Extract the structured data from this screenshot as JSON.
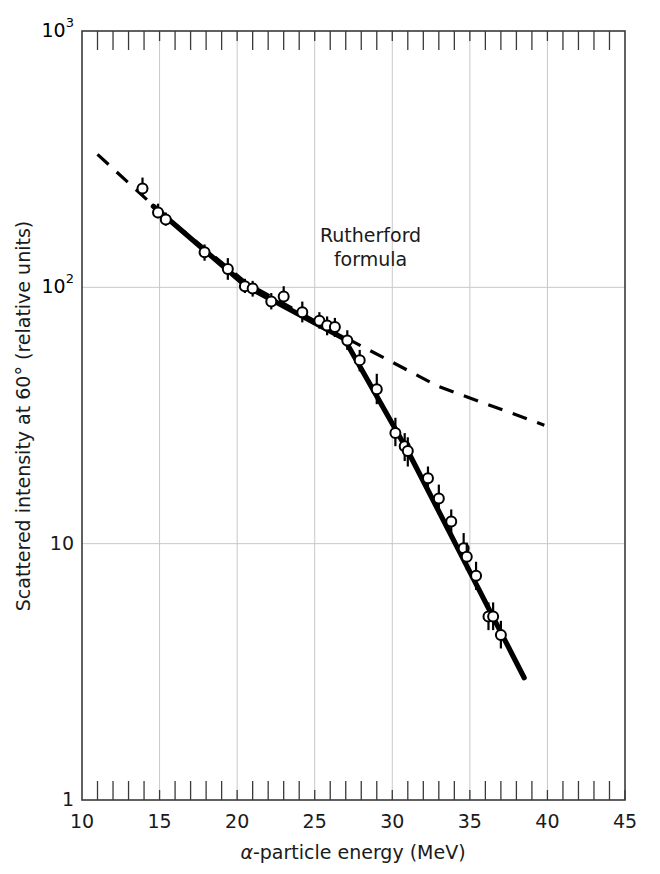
{
  "figure": {
    "background_color": "#ffffff",
    "frame_color": "#3a3a3a",
    "grid_color": "#c8c8c8",
    "data_color": "#000000"
  },
  "axes": {
    "x": {
      "label": "α-particle energy (MeV)",
      "label_parts": {
        "alpha": "α",
        "rest": "-particle energy (MeV)"
      },
      "scale": "linear",
      "min": 10,
      "max": 45,
      "major_ticks": [
        10,
        15,
        20,
        25,
        30,
        35,
        40,
        45
      ],
      "major_tick_labels": [
        "10",
        "15",
        "20",
        "25",
        "30",
        "35",
        "40",
        "45"
      ],
      "minor_tick_step": 1,
      "gridlines_at": [
        15,
        20,
        25,
        30,
        35,
        40
      ]
    },
    "y": {
      "label": "Scattered intensity at 60° (relative units)",
      "scale": "log",
      "min": 1,
      "max": 1000,
      "major_ticks": [
        1,
        10,
        100,
        1000
      ],
      "major_tick_labels": [
        "1",
        "10",
        "10",
        "10"
      ],
      "tick_label_1": "1",
      "tick_label_10": "10",
      "tick_label_100_base": "10",
      "tick_label_100_exp": "2",
      "tick_label_1000_base": "10",
      "tick_label_1000_exp": "3",
      "gridlines_at": [
        10,
        100
      ]
    }
  },
  "annotations": [
    {
      "id": "rutherford-label",
      "line1": "Rutherford",
      "line2": "formula",
      "x_data": 28.6,
      "y_data": 150
    }
  ],
  "chart_data": {
    "type": "scatter",
    "title": "",
    "xlabel": "α-particle energy (MeV)",
    "ylabel": "Scattered intensity at 60° (relative units)",
    "xlim": [
      10,
      45
    ],
    "ylim": [
      1,
      1000
    ],
    "xscale": "linear",
    "yscale": "log",
    "grid": true,
    "legend": "none",
    "series": [
      {
        "name": "Measured scattered intensity",
        "type": "scatter",
        "marker": "open-circle",
        "error_bars": "vertical",
        "points": [
          {
            "x": 13.9,
            "y": 243,
            "yerr_lo": 228,
            "yerr_hi": 268
          },
          {
            "x": 14.9,
            "y": 196,
            "yerr_lo": 186,
            "yerr_hi": 212
          },
          {
            "x": 15.4,
            "y": 184,
            "yerr_lo": 174,
            "yerr_hi": 196
          },
          {
            "x": 17.9,
            "y": 137,
            "yerr_lo": 127,
            "yerr_hi": 147
          },
          {
            "x": 19.4,
            "y": 118,
            "yerr_lo": 107,
            "yerr_hi": 130
          },
          {
            "x": 20.5,
            "y": 101,
            "yerr_lo": 95,
            "yerr_hi": 108
          },
          {
            "x": 21.0,
            "y": 99,
            "yerr_lo": 92,
            "yerr_hi": 106
          },
          {
            "x": 22.2,
            "y": 88,
            "yerr_lo": 82,
            "yerr_hi": 95
          },
          {
            "x": 23.0,
            "y": 92,
            "yerr_lo": 84,
            "yerr_hi": 101
          },
          {
            "x": 24.2,
            "y": 80,
            "yerr_lo": 73,
            "yerr_hi": 88
          },
          {
            "x": 25.3,
            "y": 74,
            "yerr_lo": 69,
            "yerr_hi": 80
          },
          {
            "x": 25.8,
            "y": 71,
            "yerr_lo": 65,
            "yerr_hi": 77
          },
          {
            "x": 26.3,
            "y": 70,
            "yerr_lo": 64,
            "yerr_hi": 76
          },
          {
            "x": 27.1,
            "y": 62,
            "yerr_lo": 57,
            "yerr_hi": 68
          },
          {
            "x": 27.9,
            "y": 52,
            "yerr_lo": 47,
            "yerr_hi": 57
          },
          {
            "x": 29.0,
            "y": 40,
            "yerr_lo": 35,
            "yerr_hi": 46
          },
          {
            "x": 30.2,
            "y": 27,
            "yerr_lo": 24,
            "yerr_hi": 31
          },
          {
            "x": 30.8,
            "y": 24,
            "yerr_lo": 21,
            "yerr_hi": 27
          },
          {
            "x": 31.0,
            "y": 23,
            "yerr_lo": 20,
            "yerr_hi": 26
          },
          {
            "x": 32.3,
            "y": 18,
            "yerr_lo": 16,
            "yerr_hi": 20
          },
          {
            "x": 33.0,
            "y": 15,
            "yerr_lo": 13.5,
            "yerr_hi": 17
          },
          {
            "x": 33.8,
            "y": 12.2,
            "yerr_lo": 11,
            "yerr_hi": 13.6
          },
          {
            "x": 34.6,
            "y": 9.6,
            "yerr_lo": 8.4,
            "yerr_hi": 11.0
          },
          {
            "x": 34.8,
            "y": 8.9,
            "yerr_lo": 7.9,
            "yerr_hi": 10.1
          },
          {
            "x": 35.4,
            "y": 7.5,
            "yerr_lo": 6.6,
            "yerr_hi": 8.5
          },
          {
            "x": 36.2,
            "y": 5.2,
            "yerr_lo": 4.6,
            "yerr_hi": 5.9
          },
          {
            "x": 36.5,
            "y": 5.2,
            "yerr_lo": 4.6,
            "yerr_hi": 5.9
          },
          {
            "x": 37.0,
            "y": 4.4,
            "yerr_lo": 3.9,
            "yerr_hi": 5.0
          }
        ]
      },
      {
        "name": "Fitted experimental curve",
        "type": "line",
        "style": "solid",
        "width": 5,
        "points": [
          {
            "x": 14.6,
            "y": 207
          },
          {
            "x": 20.6,
            "y": 101
          },
          {
            "x": 26.9,
            "y": 63
          },
          {
            "x": 31.0,
            "y": 23
          },
          {
            "x": 38.5,
            "y": 3.0
          }
        ]
      },
      {
        "name": "Rutherford formula",
        "type": "line",
        "style": "dashed",
        "width": 3,
        "points": [
          {
            "x": 11.0,
            "y": 330
          },
          {
            "x": 15.0,
            "y": 198
          },
          {
            "x": 20.6,
            "y": 104
          },
          {
            "x": 26.9,
            "y": 64
          },
          {
            "x": 33.0,
            "y": 41
          },
          {
            "x": 39.8,
            "y": 29
          }
        ]
      }
    ]
  }
}
